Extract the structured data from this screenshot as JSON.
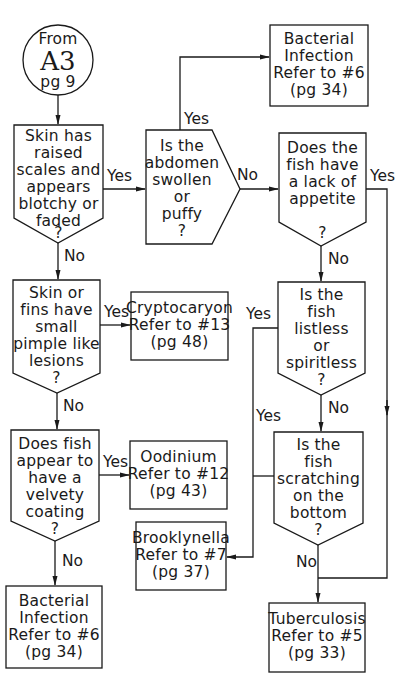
{
  "start": {
    "line1": "From",
    "line2": "A3",
    "line3": "pg 9"
  },
  "nodes": {
    "q_raised_scales": {
      "lines": [
        "Skin has",
        "raised",
        "scales and",
        "appears",
        "blotchy or",
        "faded",
        "?"
      ]
    },
    "q_abdomen": {
      "lines": [
        "Is the",
        "abdomen",
        "swollen",
        "or",
        "puffy",
        "?"
      ]
    },
    "r_bacterial_top": {
      "lines": [
        "Bacterial",
        "Infection",
        "Refer to #6",
        "(pg 34)"
      ]
    },
    "q_appetite": {
      "lines": [
        "Does the",
        "fish have",
        "a lack of",
        "appetite",
        "",
        "?"
      ]
    },
    "q_pimple": {
      "lines": [
        "Skin or",
        "fins have",
        "small",
        "pimple like",
        "lesions",
        "?"
      ]
    },
    "r_cryptocaryon": {
      "lines": [
        "Cryptocaryon",
        "Refer to #13",
        "(pg 48)"
      ]
    },
    "q_listless": {
      "lines": [
        "Is the",
        "fish",
        "listless",
        "or",
        "spiritless",
        "?"
      ]
    },
    "q_velvety": {
      "lines": [
        "Does fish",
        "appear to",
        "have a",
        "velvety",
        "coating",
        "?"
      ]
    },
    "r_oodinium": {
      "lines": [
        "Oodinium",
        "Refer to #12",
        "(pg 43)"
      ]
    },
    "r_brooklynella": {
      "lines": [
        "Brooklynella",
        "Refer to #7",
        "(pg 37)"
      ]
    },
    "q_scratching": {
      "lines": [
        "Is the",
        "fish",
        "scratching",
        "on the",
        "bottom",
        "?"
      ]
    },
    "r_bacterial_bottom": {
      "lines": [
        "Bacterial",
        "Infection",
        "Refer to #6",
        "(pg 34)"
      ]
    },
    "r_tuberculosis": {
      "lines": [
        "Tuberculosis",
        "Refer to #5",
        "(pg 33)"
      ]
    }
  },
  "edge_labels": {
    "yes": "Yes",
    "no": "No"
  },
  "colors": {
    "line": "#1a1a1a",
    "background": "#ffffff"
  }
}
